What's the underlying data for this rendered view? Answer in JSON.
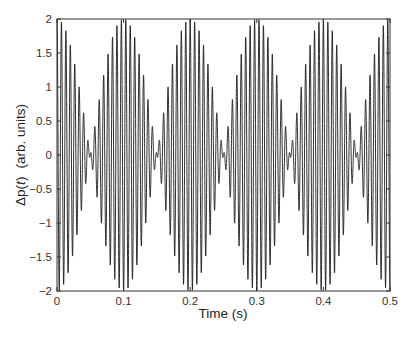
{
  "chart_data": {
    "type": "line",
    "title": "",
    "xlabel": "Time (s)",
    "ylabel": "Δp(t)  (arb. units)",
    "ylabel_parts": {
      "delta_p": "Δp(",
      "t": "t",
      "close": ")",
      "units": "(arb. units)"
    },
    "xlim": [
      0,
      0.5
    ],
    "ylim": [
      -2,
      2
    ],
    "xticks": [
      0,
      0.1,
      0.2,
      0.3,
      0.4,
      0.5
    ],
    "xtick_labels": [
      "0",
      "0.1",
      "0.2",
      "0.3",
      "0.4",
      "0.5"
    ],
    "yticks": [
      2,
      1.5,
      1,
      0.5,
      0,
      -0.5,
      -1,
      -1.5,
      -2
    ],
    "ytick_labels": [
      "2",
      "1.5",
      "1",
      "0.5",
      "0",
      "−0.5",
      "−1",
      "−1.5",
      "−2"
    ],
    "grid": false,
    "legend": null,
    "series": [
      {
        "name": "beat signal",
        "description": "Sum of two unit-amplitude cosines (145 Hz and 155 Hz) producing a beat envelope with 10 Hz beat frequency",
        "components_hz": [
          145,
          155
        ],
        "carrier_hz": 150,
        "beat_hz": 10,
        "envelope_max_times_s": [
          0,
          0.1,
          0.2,
          0.3,
          0.4,
          0.5
        ],
        "envelope_node_times_s": [
          0.05,
          0.15,
          0.25,
          0.35,
          0.45
        ],
        "peak_amplitude": 2,
        "color": "#1a1a1a"
      }
    ]
  }
}
